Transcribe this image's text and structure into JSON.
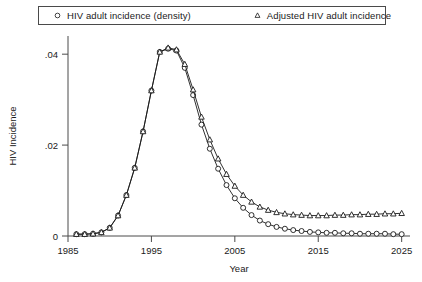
{
  "legend": {
    "entries": [
      {
        "label": "HIV adult incidence (density)",
        "marker": "circle-marker-icon"
      },
      {
        "label": "Adjusted HIV adult incidence",
        "marker": "triangle-marker-icon"
      }
    ]
  },
  "chart_data": {
    "type": "line",
    "title": "",
    "xlabel": "Year",
    "ylabel": "HIV Incidence",
    "xlim": [
      1985,
      2026
    ],
    "ylim": [
      0,
      0.044
    ],
    "xticks": [
      1985,
      1995,
      2005,
      2015,
      2025
    ],
    "xticklabels": [
      "1985",
      "1995",
      "2005",
      "2015",
      "2025"
    ],
    "yticks": [
      0,
      0.02,
      0.04
    ],
    "yticklabels": [
      "0",
      ".02",
      ".04"
    ],
    "grid": false,
    "legend_position": "top",
    "x": [
      1986,
      1987,
      1988,
      1989,
      1990,
      1991,
      1992,
      1993,
      1994,
      1995,
      1996,
      1997,
      1998,
      1999,
      2000,
      2001,
      2002,
      2003,
      2004,
      2005,
      2006,
      2007,
      2008,
      2009,
      2010,
      2011,
      2012,
      2013,
      2014,
      2015,
      2016,
      2017,
      2018,
      2019,
      2020,
      2021,
      2022,
      2023,
      2024,
      2025
    ],
    "series": [
      {
        "name": "HIV adult incidence (density)",
        "marker": "circle",
        "values": [
          0.0004,
          0.0004,
          0.0005,
          0.0008,
          0.0018,
          0.0045,
          0.009,
          0.015,
          0.023,
          0.032,
          0.0405,
          0.0412,
          0.0408,
          0.037,
          0.031,
          0.0245,
          0.0192,
          0.0148,
          0.0112,
          0.0083,
          0.0062,
          0.0046,
          0.0034,
          0.0026,
          0.002,
          0.0016,
          0.0013,
          0.0011,
          0.0009,
          0.0008,
          0.0007,
          0.0007,
          0.0006,
          0.0006,
          0.0005,
          0.0005,
          0.0005,
          0.0005,
          0.0004,
          0.0004
        ]
      },
      {
        "name": "Adjusted HIV adult incidence",
        "marker": "triangle",
        "values": [
          0.0004,
          0.0004,
          0.0005,
          0.0008,
          0.0018,
          0.0045,
          0.009,
          0.015,
          0.023,
          0.032,
          0.0405,
          0.0414,
          0.041,
          0.0378,
          0.0322,
          0.0262,
          0.0212,
          0.017,
          0.0136,
          0.011,
          0.009,
          0.0075,
          0.0064,
          0.0057,
          0.0052,
          0.0049,
          0.0047,
          0.0046,
          0.0045,
          0.0045,
          0.0045,
          0.0046,
          0.0046,
          0.0047,
          0.0047,
          0.0048,
          0.0048,
          0.0049,
          0.0049,
          0.005
        ]
      }
    ]
  }
}
